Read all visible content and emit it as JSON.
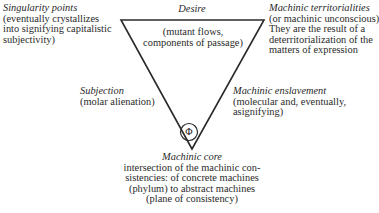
{
  "diagram": {
    "top_vertex_label": {
      "title": "Desire",
      "lines": []
    },
    "inside_label": {
      "lines": [
        "(mutant flows,",
        "components of passage)"
      ]
    },
    "top_left": {
      "title": "Singularity points",
      "lines": [
        "(eventually crystallizes",
        "into signifying capitalistic",
        "subjectivity)"
      ]
    },
    "top_right": {
      "title": "Machinic territorialities",
      "lines": [
        "(or machinic unconscious)",
        "They are the result of a",
        "deterritorialization of the",
        "matters of expression"
      ]
    },
    "left_side": {
      "title": "Subjection",
      "lines": [
        "(molar alienation)"
      ]
    },
    "right_side": {
      "title": "Machinic enslavement",
      "lines": [
        "(molecular and, eventually,",
        "asignifying)"
      ]
    },
    "bottom": {
      "title": "Machinic core",
      "lines": [
        "intersection of the machinic con-",
        "sistencies: of concrete machines",
        "(phylum) to abstract machines",
        "(plane of consistency)"
      ]
    },
    "core_symbol": "Φ",
    "colors": {
      "stroke": "#2a2a2a",
      "text": "#2a2a2a",
      "background": "#ffffff"
    }
  }
}
